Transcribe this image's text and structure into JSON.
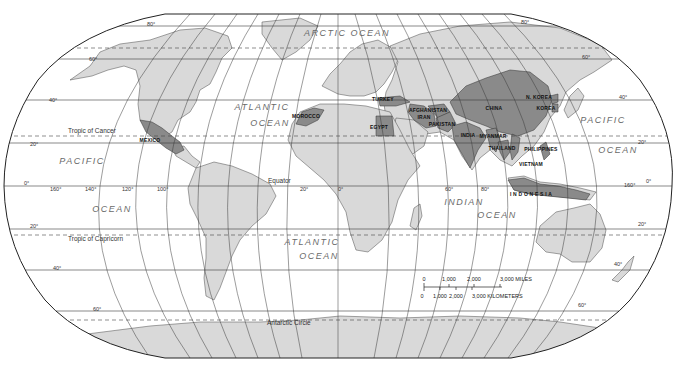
{
  "map": {
    "title": "World Map",
    "colors": {
      "background": "#ffffff",
      "ocean": "#ffffff",
      "land": "#d9d9d9",
      "highlight": "#8a8a8a",
      "border": "#4a4a4a",
      "graticule": "#3a3a3a",
      "dashed": "#444444",
      "ocean_label": "#6a6a6a"
    },
    "oceans": [
      {
        "id": "arctic",
        "label": "ARCTIC OCEAN",
        "x": 347,
        "y": 36,
        "size": 6.5
      },
      {
        "id": "atlantic-n-1",
        "label": "ATLANTIC",
        "x": 262,
        "y": 110,
        "size": 9
      },
      {
        "id": "atlantic-n-2",
        "label": "OCEAN",
        "x": 270,
        "y": 126,
        "size": 9
      },
      {
        "id": "pacific-w-1",
        "label": "PACIFIC",
        "x": 82,
        "y": 164,
        "size": 9
      },
      {
        "id": "pacific-w-2",
        "label": "OCEAN",
        "x": 112,
        "y": 212,
        "size": 9
      },
      {
        "id": "pacific-e-1",
        "label": "PACIFIC",
        "x": 603,
        "y": 123,
        "size": 9
      },
      {
        "id": "pacific-e-2",
        "label": "OCEAN",
        "x": 618,
        "y": 153,
        "size": 9
      },
      {
        "id": "atlantic-s-1",
        "label": "ATLANTIC",
        "x": 312,
        "y": 245,
        "size": 9
      },
      {
        "id": "atlantic-s-2",
        "label": "OCEAN",
        "x": 319,
        "y": 259,
        "size": 9
      },
      {
        "id": "indian-1",
        "label": "INDIAN",
        "x": 464,
        "y": 205,
        "size": 9
      },
      {
        "id": "indian-2",
        "label": "OCEAN",
        "x": 497,
        "y": 218,
        "size": 9
      }
    ],
    "reference_lines": [
      {
        "id": "tropic-cancer",
        "label": "Tropic of Cancer",
        "y": 136,
        "label_x": 68,
        "label_y": 133
      },
      {
        "id": "equator",
        "label": "Equator",
        "y": 186,
        "label_x": 268,
        "label_y": 183
      },
      {
        "id": "tropic-capricorn",
        "label": "Tropic of Capricorn",
        "y": 235,
        "label_x": 68,
        "label_y": 241
      },
      {
        "id": "antarctic-circle",
        "label": "Antarctic Circle",
        "y": 320,
        "label_x": 267,
        "label_y": 325
      }
    ],
    "latitude_labels": [
      {
        "label": "80°",
        "x": 147,
        "y": 27
      },
      {
        "label": "80°",
        "x": 521,
        "y": 25
      },
      {
        "label": "60°",
        "x": 89,
        "y": 62
      },
      {
        "label": "60°",
        "x": 582,
        "y": 60
      },
      {
        "label": "40°",
        "x": 49,
        "y": 103
      },
      {
        "label": "40°",
        "x": 619,
        "y": 100
      },
      {
        "label": "20°",
        "x": 30,
        "y": 147
      },
      {
        "label": "20°",
        "x": 638,
        "y": 145
      },
      {
        "label": "0°",
        "x": 24,
        "y": 186
      },
      {
        "label": "0°",
        "x": 646,
        "y": 184
      },
      {
        "label": "20°",
        "x": 30,
        "y": 229
      },
      {
        "label": "20°",
        "x": 638,
        "y": 227
      },
      {
        "label": "40°",
        "x": 53,
        "y": 271
      },
      {
        "label": "40°",
        "x": 614,
        "y": 267
      },
      {
        "label": "60°",
        "x": 93,
        "y": 312
      },
      {
        "label": "60°",
        "x": 578,
        "y": 308
      }
    ],
    "longitude_labels": [
      {
        "label": "160°",
        "x": 50,
        "y": 191
      },
      {
        "label": "140°",
        "x": 85,
        "y": 191
      },
      {
        "label": "120°",
        "x": 122,
        "y": 191
      },
      {
        "label": "100°",
        "x": 157,
        "y": 191
      },
      {
        "label": "20°",
        "x": 300,
        "y": 191
      },
      {
        "label": "0°",
        "x": 338,
        "y": 191
      },
      {
        "label": "60°",
        "x": 445,
        "y": 191
      },
      {
        "label": "80°",
        "x": 481,
        "y": 191
      },
      {
        "label": "160°",
        "x": 624,
        "y": 187
      }
    ],
    "highlighted_countries": [
      {
        "id": "mexico",
        "label": "MEXICO",
        "x": 150,
        "y": 142
      },
      {
        "id": "morocco",
        "label": "MOROCCO",
        "x": 306,
        "y": 118
      },
      {
        "id": "egypt",
        "label": "EGYPT",
        "x": 379,
        "y": 129
      },
      {
        "id": "turkey",
        "label": "TURKEY",
        "x": 383,
        "y": 101
      },
      {
        "id": "iran",
        "label": "IRAN",
        "x": 424,
        "y": 119
      },
      {
        "id": "afghanistan",
        "label": "AFGHANISTAN",
        "x": 428,
        "y": 112
      },
      {
        "id": "pakistan",
        "label": "PAKISTAN",
        "x": 442,
        "y": 126
      },
      {
        "id": "india",
        "label": "INDIA",
        "x": 468,
        "y": 137
      },
      {
        "id": "china",
        "label": "CHINA",
        "x": 494,
        "y": 110
      },
      {
        "id": "myanmar",
        "label": "MYANMAR",
        "x": 493,
        "y": 138
      },
      {
        "id": "thailand",
        "label": "THAILAND",
        "x": 502,
        "y": 150
      },
      {
        "id": "vietnam",
        "label": "VIETNAM",
        "x": 531,
        "y": 166
      },
      {
        "id": "n-korea",
        "label": "N. KOREA",
        "x": 539,
        "y": 99
      },
      {
        "id": "korea",
        "label": "KOREA",
        "x": 546,
        "y": 110
      },
      {
        "id": "philippines",
        "label": "PHILIPPINES",
        "x": 541,
        "y": 151
      },
      {
        "id": "indonesia",
        "label": "I N D O N E S I A",
        "x": 531,
        "y": 196
      }
    ],
    "scale_bar": {
      "miles": {
        "ticks": [
          "0",
          "1,000",
          "2,000",
          "3,000 MILES"
        ]
      },
      "kilometers": {
        "ticks": [
          "0",
          "1,000",
          "2,000",
          "3,000 KILOMETERS"
        ]
      }
    }
  }
}
